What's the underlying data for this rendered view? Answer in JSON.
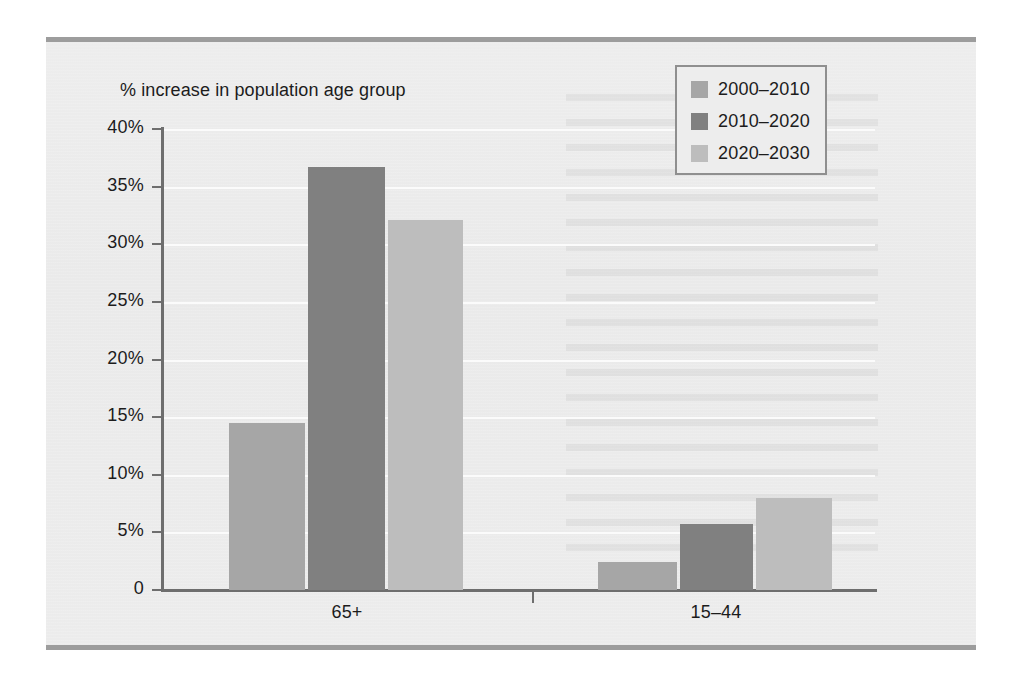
{
  "chart_data": {
    "type": "bar",
    "title": "",
    "subtitle": "",
    "xlabel": "",
    "ylabel": "% increase in population age group",
    "categories": [
      "65+",
      "15–44"
    ],
    "series": [
      {
        "name": "2000–2010",
        "color": "#a6a6a6",
        "values": [
          14.5,
          2.4
        ]
      },
      {
        "name": "2010–2020",
        "color": "#808080",
        "values": [
          36.7,
          5.7
        ]
      },
      {
        "name": "2020–2030",
        "color": "#bdbdbd",
        "values": [
          32.1,
          8.0
        ]
      }
    ],
    "ylim": [
      0,
      40
    ],
    "ytick_values": [
      0,
      5,
      10,
      15,
      20,
      25,
      30,
      35,
      40
    ],
    "ytick_labels": [
      "0",
      "5%",
      "10%",
      "15%",
      "20%",
      "25%",
      "30%",
      "35%",
      "40%"
    ],
    "grid": true,
    "gridline_color": "#fbfbfb",
    "legend_position": "top-right",
    "axis_color": "#6e6e6e",
    "background_color": "#ececec"
  },
  "legend": {
    "items": [
      {
        "label": "2000–2010"
      },
      {
        "label": "2010–2020"
      },
      {
        "label": "2020–2030"
      }
    ]
  },
  "axis": {
    "y_title": "% increase in population age group"
  }
}
